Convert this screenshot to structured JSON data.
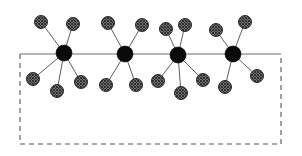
{
  "figure": {
    "type": "node-link-diagram",
    "canvas": {
      "width": 302,
      "height": 156,
      "background": "#ffffff"
    },
    "palette": {
      "hub_fill": "#0a0a0a",
      "satellite_fill": "#9a9a9a",
      "satellite_pattern": "crosshatch",
      "satellite_stroke": "#1a1a1a",
      "edge_stroke": "#4d4d4d",
      "boundary_stroke": "#555555",
      "interface_stroke": "#6b6b6b"
    },
    "geometry": {
      "hub_radius": 8.0,
      "satellite_radius": 6.5,
      "edge_width": 0.9,
      "boundary_dash": "5 4"
    },
    "boundary": {
      "name": "dashed-region",
      "left": 20,
      "right": 281,
      "top": 54,
      "bottom": 144,
      "top_edge_style": "solid",
      "other_edges_style": "dashed"
    },
    "interface_line": {
      "name": "substrate-interface",
      "x1": 20,
      "y1": 54,
      "x2": 281,
      "y2": 54,
      "style": "solid"
    },
    "hubs": [
      {
        "id": "hub-1",
        "label": "1",
        "cx": 64,
        "cy": 53
      },
      {
        "id": "hub-2",
        "label": "2",
        "cx": 125,
        "cy": 54
      },
      {
        "id": "hub-3",
        "label": "3",
        "cx": 178,
        "cy": 55
      },
      {
        "id": "hub-4",
        "label": "4",
        "cx": 233,
        "cy": 54
      }
    ],
    "satellites": [
      {
        "id": "sat-1a",
        "hub": "hub-1",
        "side": "above",
        "cx": 41,
        "cy": 22
      },
      {
        "id": "sat-1b",
        "hub": "hub-1",
        "side": "above",
        "cx": 73,
        "cy": 24
      },
      {
        "id": "sat-1c",
        "hub": "hub-1",
        "side": "below",
        "cx": 33,
        "cy": 79
      },
      {
        "id": "sat-1d",
        "hub": "hub-1",
        "side": "below",
        "cx": 57,
        "cy": 91
      },
      {
        "id": "sat-1e",
        "hub": "hub-1",
        "side": "below",
        "cx": 81,
        "cy": 82
      },
      {
        "id": "sat-2a",
        "hub": "hub-2",
        "side": "above",
        "cx": 108,
        "cy": 23
      },
      {
        "id": "sat-2b",
        "hub": "hub-2",
        "side": "above",
        "cx": 142,
        "cy": 25
      },
      {
        "id": "sat-2c",
        "hub": "hub-2",
        "side": "below",
        "cx": 106,
        "cy": 85
      },
      {
        "id": "sat-2d",
        "hub": "hub-2",
        "side": "below",
        "cx": 136,
        "cy": 85
      },
      {
        "id": "sat-3a",
        "hub": "hub-3",
        "side": "above",
        "cx": 166,
        "cy": 29
      },
      {
        "id": "sat-3b",
        "hub": "hub-3",
        "side": "above",
        "cx": 185,
        "cy": 25
      },
      {
        "id": "sat-3c",
        "hub": "hub-3",
        "side": "below",
        "cx": 158,
        "cy": 81
      },
      {
        "id": "sat-3d",
        "hub": "hub-3",
        "side": "below",
        "cx": 181,
        "cy": 93
      },
      {
        "id": "sat-3e",
        "hub": "hub-3",
        "side": "below",
        "cx": 203,
        "cy": 80
      },
      {
        "id": "sat-4a",
        "hub": "hub-4",
        "side": "above",
        "cx": 216,
        "cy": 30
      },
      {
        "id": "sat-4b",
        "hub": "hub-4",
        "side": "above",
        "cx": 245,
        "cy": 22
      },
      {
        "id": "sat-4c",
        "hub": "hub-4",
        "side": "below",
        "cx": 225,
        "cy": 87
      },
      {
        "id": "sat-4d",
        "hub": "hub-4",
        "side": "below",
        "cx": 257,
        "cy": 76
      }
    ],
    "edges": [
      {
        "from": "hub-1",
        "to": "sat-1a"
      },
      {
        "from": "hub-1",
        "to": "sat-1b"
      },
      {
        "from": "hub-1",
        "to": "sat-1c"
      },
      {
        "from": "hub-1",
        "to": "sat-1d"
      },
      {
        "from": "hub-1",
        "to": "sat-1e"
      },
      {
        "from": "hub-2",
        "to": "sat-2a"
      },
      {
        "from": "hub-2",
        "to": "sat-2b"
      },
      {
        "from": "hub-2",
        "to": "sat-2c"
      },
      {
        "from": "hub-2",
        "to": "sat-2d"
      },
      {
        "from": "hub-3",
        "to": "sat-3a"
      },
      {
        "from": "hub-3",
        "to": "sat-3b"
      },
      {
        "from": "hub-3",
        "to": "sat-3c"
      },
      {
        "from": "hub-3",
        "to": "sat-3d"
      },
      {
        "from": "hub-3",
        "to": "sat-3e"
      },
      {
        "from": "hub-4",
        "to": "sat-4a"
      },
      {
        "from": "hub-4",
        "to": "sat-4b"
      },
      {
        "from": "hub-4",
        "to": "sat-4c"
      },
      {
        "from": "hub-4",
        "to": "sat-4d"
      }
    ]
  }
}
